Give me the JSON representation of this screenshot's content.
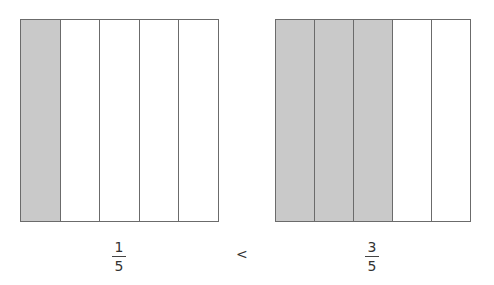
{
  "models": [
    {
      "name": "left",
      "parts": 5,
      "shaded": 1,
      "fraction": {
        "numerator": "1",
        "denominator": "5"
      }
    },
    {
      "name": "right",
      "parts": 5,
      "shaded": 3,
      "fraction": {
        "numerator": "3",
        "denominator": "5"
      }
    }
  ],
  "comparison": "<",
  "colors": {
    "shaded": "#c9c9c9",
    "border": "#6b6b6b",
    "background": "#ffffff"
  }
}
